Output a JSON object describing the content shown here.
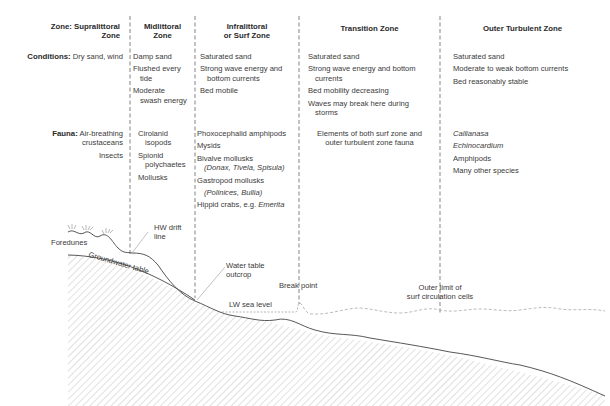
{
  "row_labels": {
    "zone_prefix": "Zone:",
    "conditions_prefix": "Conditions:",
    "fauna_prefix": "Fauna:"
  },
  "zones": [
    {
      "name_line1": "Supralittoral",
      "name_line2": "Zone",
      "conditions": [
        "Dry sand, wind"
      ],
      "fauna": [
        "Air-breathing",
        "crustaceans",
        "Insects"
      ]
    },
    {
      "name_line1": "Midlittoral",
      "name_line2": "Zone",
      "conditions": [
        "Damp sand",
        "Flushed every",
        "tide",
        "Moderate",
        "swash energy"
      ],
      "fauna": [
        "Cirolanid",
        "isopods",
        "Spionid",
        "polychaetes",
        "Mollusks"
      ]
    },
    {
      "name_line1": "Infralittoral",
      "name_line2": "or Surf Zone",
      "conditions": [
        "Saturated sand",
        "Strong wave energy and",
        "bottom currents",
        "Bed mobile"
      ],
      "fauna": [
        "Phoxocephalid amphipods",
        "Mysids",
        "Bivalve mollusks",
        "(Donax, Tivela, Spisula)",
        "Gastropod mollusks",
        "(Polinices, Bullia)",
        "Hippid crabs, e.g. ",
        "Emerita"
      ]
    },
    {
      "name_line1": "Transition Zone",
      "conditions": [
        "Saturated sand",
        "Strong wave energy and bottom",
        "currents",
        "Bed mobility decreasing",
        "Waves may break here during",
        "storms"
      ],
      "fauna": [
        "Elements of both surf zone and",
        "outer turbulent zone fauna"
      ]
    },
    {
      "name_line1": "Outer Turbulent Zone",
      "conditions": [
        "Saturated sand",
        "Moderate to weak bottom currents",
        "Bed reasonably stable"
      ],
      "fauna": [
        "Callianasa",
        "Echinocardium",
        "Amphipods",
        "Many other species"
      ]
    }
  ],
  "profile_labels": {
    "foredunes": "Foredunes",
    "hw_drift_line_1": "HW drift",
    "hw_drift_line_2": "line",
    "groundwater_table": "Groundwater table",
    "water_table_outcrop_1": "Water table",
    "water_table_outcrop_2": "outcrop",
    "lw_sea_level": "LW sea level",
    "break_point": "Break point",
    "outer_limit_1": "Outer limit of",
    "outer_limit_2": "surf circulation cells"
  },
  "colors": {
    "text": "#3a3a3a",
    "line": "#555555",
    "hatch": "#bbbbbb",
    "water": "#aaaaaa"
  }
}
